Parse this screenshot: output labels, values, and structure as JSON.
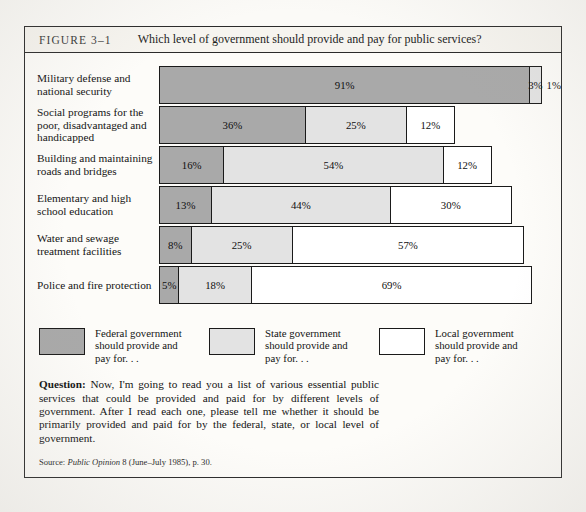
{
  "figure": {
    "number": "FIGURE 3–1",
    "title": "Which level of government should provide and pay for public services?"
  },
  "chart_data": {
    "type": "bar",
    "orientation": "horizontal",
    "stacked": true,
    "title": "Which level of government should provide and pay for public services?",
    "xlabel": "",
    "ylabel": "",
    "xlim": [
      0,
      100
    ],
    "grid": false,
    "legend_position": "bottom",
    "unit": "%",
    "categories": [
      "Military defense and national security",
      "Social programs for the poor, disadvantaged and handicapped",
      "Building and maintaining roads and bridges",
      "Elementary and high school education",
      "Water and sewage treatment facilities",
      "Police and fire protection"
    ],
    "series": [
      {
        "name": "Federal government should provide and pay for. . .",
        "color": "#a9a9a9",
        "values": [
          91,
          36,
          16,
          13,
          8,
          5
        ]
      },
      {
        "name": "State government should provide and pay for. . .",
        "color": "#e3e3e3",
        "values": [
          3,
          25,
          54,
          44,
          25,
          18
        ]
      },
      {
        "name": "Local government should provide and pay for. . .",
        "color": "#ffffff",
        "values": [
          1,
          12,
          12,
          30,
          57,
          69
        ]
      }
    ]
  },
  "rows": [
    {
      "label_line1": "Military defense and",
      "label_line2": "national security",
      "label_line3": "",
      "segments": [
        {
          "level": "federal",
          "value": 91,
          "label": "91%",
          "outside": false
        },
        {
          "level": "state",
          "value": 3,
          "label": "3%",
          "outside": false
        },
        {
          "level": "local",
          "value": 1,
          "label": "1%",
          "outside": true
        }
      ]
    },
    {
      "label_line1": "Social programs for the",
      "label_line2": "poor, disadvantaged and",
      "label_line3": "handicapped",
      "segments": [
        {
          "level": "federal",
          "value": 36,
          "label": "36%",
          "outside": false
        },
        {
          "level": "state",
          "value": 25,
          "label": "25%",
          "outside": false
        },
        {
          "level": "local",
          "value": 12,
          "label": "12%",
          "outside": false
        }
      ]
    },
    {
      "label_line1": "Building and maintaining",
      "label_line2": "roads and bridges",
      "label_line3": "",
      "segments": [
        {
          "level": "federal",
          "value": 16,
          "label": "16%",
          "outside": false
        },
        {
          "level": "state",
          "value": 54,
          "label": "54%",
          "outside": false
        },
        {
          "level": "local",
          "value": 12,
          "label": "12%",
          "outside": false
        }
      ]
    },
    {
      "label_line1": "Elementary and high",
      "label_line2": "school education",
      "label_line3": "",
      "segments": [
        {
          "level": "federal",
          "value": 13,
          "label": "13%",
          "outside": false
        },
        {
          "level": "state",
          "value": 44,
          "label": "44%",
          "outside": false
        },
        {
          "level": "local",
          "value": 30,
          "label": "30%",
          "outside": false
        }
      ]
    },
    {
      "label_line1": "Water and sewage",
      "label_line2": "treatment facilities",
      "label_line3": "",
      "segments": [
        {
          "level": "federal",
          "value": 8,
          "label": "8%",
          "outside": false
        },
        {
          "level": "state",
          "value": 25,
          "label": "25%",
          "outside": false
        },
        {
          "level": "local",
          "value": 57,
          "label": "57%",
          "outside": false
        }
      ]
    },
    {
      "label_line1": "Police and fire protection",
      "label_line2": "",
      "label_line3": "",
      "segments": [
        {
          "level": "federal",
          "value": 5,
          "label": "5%",
          "outside": false
        },
        {
          "level": "state",
          "value": 18,
          "label": "18%",
          "outside": false
        },
        {
          "level": "local",
          "value": 69,
          "label": "69%",
          "outside": false
        }
      ]
    }
  ],
  "legend": [
    {
      "level": "federal",
      "line1": "Federal government",
      "line2": "should provide and",
      "line3": "pay for. . ."
    },
    {
      "level": "state",
      "line1": "State government",
      "line2": "should provide and",
      "line3": "pay for. . ."
    },
    {
      "level": "local",
      "line1": "Local government",
      "line2": "should provide and",
      "line3": "pay for. . ."
    }
  ],
  "question": {
    "label": "Question:",
    "text": " Now, I'm going to read you a list of various essential public services that could be provided and paid for by different levels of government. After I read each one, please tell me whether it should be primarily provided and paid for by the federal, state, or local level of government."
  },
  "source": {
    "prefix": "Source: ",
    "italic": "Public Opinion",
    "suffix": " 8 (June–July 1985), p. 30."
  },
  "colors": {
    "federal": "#a9a9a9",
    "state": "#e3e3e3",
    "local": "#ffffff",
    "outline": "#1a1a1a"
  }
}
